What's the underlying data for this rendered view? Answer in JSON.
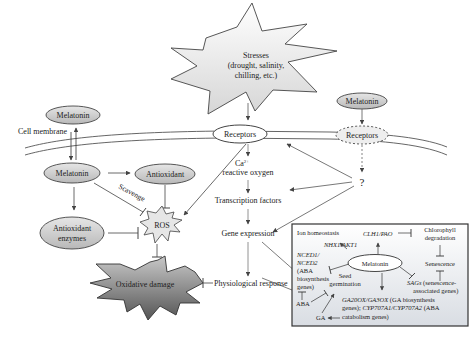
{
  "diagram": {
    "stresses": {
      "line1": "Stresses",
      "line2": "(drought, salinity,",
      "line3": "chilling, etc.)"
    },
    "cell_membrane_label": "Cell membrane",
    "melatonin_outside_left": "Melatonin",
    "melatonin_outside_right": "Melatonin",
    "receptors_main": "Receptors",
    "receptors_dashed": "Receptors",
    "melatonin_inside": "Melatonin",
    "antioxidant": "Antioxidant",
    "antioxidant_enzymes_line1": "Antioxidant",
    "antioxidant_enzymes_line2": "enzymes",
    "scavenge": "Scavenge",
    "ros": "ROS",
    "oxidative_damage": "Oxidative damage",
    "ca_line1": "Ca",
    "ca_sup": "2+",
    "ca_line2": "reactive oxygen",
    "transcription_factors": "Transcription factors",
    "gene_expression": "Gene expression",
    "physiological_response": "Physiological response",
    "question": "?",
    "inset": {
      "ion_homeostasis": "Ion homeostasis",
      "nhx1_akt1": "NHX1/AKT1",
      "clh1_pao": "CLH1/PAO",
      "chlorophyll_line1": "Chlorophyll",
      "chlorophyll_line2": "degradation",
      "melatonin": "Melatonin",
      "senescence": "Senescence",
      "nced_line1": "NCED1/",
      "nced_line2": "NCED2",
      "nced_line3": "(ABA",
      "nced_line4": "biosynthesis",
      "nced_line5": "genes)",
      "seed_line1": "Seed",
      "seed_line2": "germination",
      "sags_italic": "SAGs",
      "sags_rest": " (senescence-",
      "sags_line2": "associated genes)",
      "aba": "ABA",
      "ga": "GA",
      "ga20ox_italic": "GA20OX/GA3OX",
      "ga20ox_rest": " (GA biosynthesis",
      "genes_line2_a": "genes); ",
      "cyp_italic": "CYP707A1/CYP707A2",
      "genes_line2_b": " (ABA",
      "catabolism": "catabolism genes)"
    },
    "colors": {
      "ellipse_fill": "#c8c8c8",
      "oxidative_fill": "#7a7a7a",
      "line": "#444444",
      "inset_bg": "#eef0f3"
    }
  }
}
